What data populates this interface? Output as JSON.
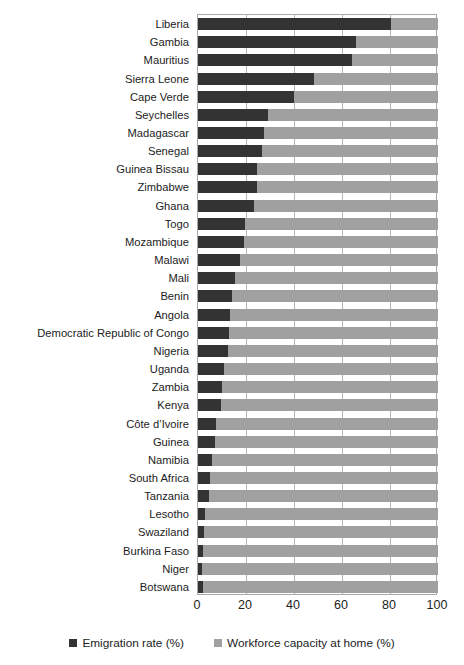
{
  "title_partial": "",
  "legend": {
    "position": "bottom",
    "items": [
      {
        "label": "Emigration rate (%)",
        "color": "#333333",
        "swatch": "square-dark-icon"
      },
      {
        "label": "Workforce capacity at home (%)",
        "color": "#a0a0a0",
        "swatch": "square-light-icon"
      }
    ]
  },
  "axis": {
    "x_ticks": [
      "0",
      "20",
      "40",
      "60",
      "80",
      "100"
    ],
    "x_tick_values": [
      0,
      20,
      40,
      60,
      80,
      100
    ],
    "xlim": [
      0,
      100
    ]
  },
  "chart_data": {
    "type": "bar",
    "orientation": "horizontal",
    "stacked": true,
    "title": "",
    "subtitle": "",
    "xlabel": "",
    "ylabel": "",
    "xlim": [
      0,
      100
    ],
    "grid": true,
    "legend_position": "bottom",
    "categories": [
      "Liberia",
      "Gambia",
      "Mauritius",
      "Sierra Leone",
      "Cape Verde",
      "Seychelles",
      "Madagascar",
      "Senegal",
      "Guinea Bissau",
      "Zimbabwe",
      "Ghana",
      "Togo",
      "Mozambique",
      "Malawi",
      "Mali",
      "Benin",
      "Angola",
      "Democratic Republic of Congo",
      "Nigeria",
      "Uganda",
      "Zambia",
      "Kenya",
      "Côte d’Ivoire",
      "Guinea",
      "Namibia",
      "South Africa",
      "Tanzania",
      "Lesotho",
      "Swaziland",
      "Burkina Faso",
      "Niger",
      "Botswana"
    ],
    "series": [
      {
        "name": "Emigration rate (%)",
        "color": "#333333",
        "values": [
          80.5,
          66.0,
          64.0,
          48.5,
          40.0,
          29.0,
          27.5,
          26.5,
          24.5,
          24.5,
          23.5,
          19.5,
          19.0,
          17.5,
          15.5,
          14.0,
          13.5,
          13.0,
          12.5,
          11.0,
          10.0,
          9.5,
          7.5,
          7.0,
          6.0,
          5.0,
          4.5,
          3.0,
          2.5,
          2.0,
          1.8,
          2.0
        ]
      },
      {
        "name": "Workforce capacity at home (%)",
        "color": "#a0a0a0",
        "values": [
          19.5,
          34.0,
          36.0,
          51.5,
          60.0,
          71.0,
          72.5,
          73.5,
          75.5,
          75.5,
          76.5,
          80.5,
          81.0,
          82.5,
          84.5,
          86.0,
          86.5,
          87.0,
          87.5,
          89.0,
          90.0,
          90.5,
          92.5,
          93.0,
          94.0,
          95.0,
          95.5,
          97.0,
          97.5,
          98.0,
          98.2,
          98.0
        ]
      }
    ]
  }
}
